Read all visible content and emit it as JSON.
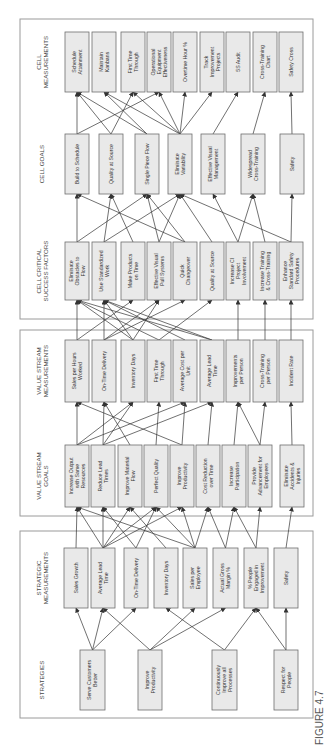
{
  "figure": {
    "caption": "FIGURE 4.7"
  },
  "columns": [
    {
      "id": "strategies",
      "heading": [
        "STRATEGIES"
      ],
      "x": 37,
      "w": 60,
      "boxes": [
        {
          "lines": [
            "Serve Customers",
            "Better"
          ],
          "y": 80,
          "h": 25
        },
        {
          "lines": [
            "Improve",
            "Productivity"
          ],
          "y": 138,
          "h": 24
        },
        {
          "lines": [
            "Continuously",
            "Improve all",
            "Processes"
          ],
          "y": 212,
          "h": 25
        },
        {
          "lines": [
            "Respect for",
            "People"
          ],
          "y": 274,
          "h": 24
        }
      ]
    },
    {
      "id": "strategic_measurements",
      "heading": [
        "STRATEGIC",
        "MEASUREMENTS"
      ],
      "x": 139,
      "w": 60,
      "boxes": [
        {
          "lines": [
            "Sales Growth"
          ],
          "y": 64,
          "h": 24
        },
        {
          "lines": [
            "Average Lead",
            "Time"
          ],
          "y": 91,
          "h": 24
        },
        {
          "lines": [
            "On-Time Delivery"
          ],
          "y": 124,
          "h": 24
        },
        {
          "lines": [
            "Inventory Days"
          ],
          "y": 154,
          "h": 24
        },
        {
          "lines": [
            "Sales per",
            "Employee"
          ],
          "y": 183,
          "h": 24
        },
        {
          "lines": [
            "Actual Gross",
            "Margin %"
          ],
          "y": 213,
          "h": 25
        },
        {
          "lines": [
            "% People",
            "Engaged in",
            "Improvement"
          ],
          "y": 244,
          "h": 24
        },
        {
          "lines": [
            "Safety"
          ],
          "y": 274,
          "h": 24
        }
      ]
    },
    {
      "id": "value_stream_goals",
      "heading": [
        "VALUE STREAM",
        "GOALS"
      ],
      "x": 240,
      "w": 62,
      "boxes": [
        {
          "lines": [
            "Increase Output",
            "with Same",
            "Resources"
          ],
          "y": 65,
          "h": 24
        },
        {
          "lines": [
            "Reduce Lead",
            "Times"
          ],
          "y": 91,
          "h": 24
        },
        {
          "lines": [
            "Improve Material",
            "Flow"
          ],
          "y": 118,
          "h": 24
        },
        {
          "lines": [
            "Perfect Quality"
          ],
          "y": 144,
          "h": 24
        },
        {
          "lines": [
            "Improve",
            "Productivity"
          ],
          "y": 170,
          "h": 24
        },
        {
          "lines": [
            "Cost Reduction",
            "over Time"
          ],
          "y": 196,
          "h": 24
        },
        {
          "lines": [
            "Increase",
            "Participation"
          ],
          "y": 222,
          "h": 24
        },
        {
          "lines": [
            "Provide",
            "Advancement for",
            "Employees"
          ],
          "y": 248,
          "h": 24
        },
        {
          "lines": [
            "Eliminate",
            "Accidents &",
            "Injuries"
          ],
          "y": 280,
          "h": 24
        }
      ]
    },
    {
      "id": "value_stream_measurements",
      "heading": [
        "VALUE STREAM",
        "MEASUREMENTS"
      ],
      "x": 345,
      "w": 62,
      "boxes": [
        {
          "lines": [
            "Sales per Hours",
            "Worked"
          ],
          "y": 65,
          "h": 24
        },
        {
          "lines": [
            "On-Time Delivery"
          ],
          "y": 92,
          "h": 24
        },
        {
          "lines": [
            "Inventory Days"
          ],
          "y": 121,
          "h": 24
        },
        {
          "lines": [
            "First Time",
            "Through"
          ],
          "y": 147,
          "h": 24
        },
        {
          "lines": [
            "Average Cost per",
            "Unit"
          ],
          "y": 173,
          "h": 24
        },
        {
          "lines": [
            "Average Lead",
            "Time"
          ],
          "y": 200,
          "h": 24
        },
        {
          "lines": [
            "Improvements",
            "per Person"
          ],
          "y": 226,
          "h": 24
        },
        {
          "lines": [
            "Cross-Training",
            "per Person"
          ],
          "y": 253,
          "h": 24
        },
        {
          "lines": [
            "Incident Rate"
          ],
          "y": 279,
          "h": 24
        }
      ]
    },
    {
      "id": "cell_critical_success_factors",
      "heading": [
        "CELL CRITICAL",
        "SUCCESS FACTORS"
      ],
      "x": 447,
      "w": 58,
      "boxes": [
        {
          "lines": [
            "Eliminate",
            "Obstacles to",
            "Flow"
          ],
          "y": 65,
          "h": 24
        },
        {
          "lines": [
            "Use Standardized",
            "Work"
          ],
          "y": 92,
          "h": 24
        },
        {
          "lines": [
            "Make Products",
            "on Time"
          ],
          "y": 121,
          "h": 24
        },
        {
          "lines": [
            "Effective Visual",
            "Pull Systems"
          ],
          "y": 147,
          "h": 24
        },
        {
          "lines": [
            "Quick",
            "Changeover"
          ],
          "y": 173,
          "h": 24
        },
        {
          "lines": [
            "Quality at Source"
          ],
          "y": 200,
          "h": 24
        },
        {
          "lines": [
            "Increase CI",
            "Project",
            "Involvement"
          ],
          "y": 226,
          "h": 24
        },
        {
          "lines": [
            "Increase Training",
            "& Cross-Training"
          ],
          "y": 253,
          "h": 24
        },
        {
          "lines": [
            "Enhance",
            "Standard Safety",
            "Procedures"
          ],
          "y": 279,
          "h": 24
        }
      ]
    },
    {
      "id": "cell_goals",
      "heading": [
        "CELL GOALS"
      ],
      "x": 553,
      "w": 60,
      "boxes": [
        {
          "lines": [
            "Build to Schedule"
          ],
          "y": 65,
          "h": 24
        },
        {
          "lines": [
            "Quality at Source"
          ],
          "y": 99,
          "h": 24
        },
        {
          "lines": [
            "Single Piece Flow"
          ],
          "y": 135,
          "h": 24
        },
        {
          "lines": [
            "Eliminate",
            "Variability"
          ],
          "y": 168,
          "h": 24
        },
        {
          "lines": [
            "Effective Visual",
            "Management"
          ],
          "y": 201,
          "h": 24
        },
        {
          "lines": [
            "Widespread",
            "Cross-Training"
          ],
          "y": 241,
          "h": 24
        },
        {
          "lines": [
            "Safety"
          ],
          "y": 280,
          "h": 24
        }
      ]
    },
    {
      "id": "cell_measurements",
      "heading": [
        "CELL",
        "MEASUREMENTS"
      ],
      "x": 655,
      "w": 60,
      "boxes": [
        {
          "lines": [
            "Schedule",
            "Attainment"
          ],
          "y": 65,
          "h": 24
        },
        {
          "lines": [
            "Maintain",
            "Kanbans"
          ],
          "y": 92,
          "h": 24
        },
        {
          "lines": [
            "First Time",
            "Through"
          ],
          "y": 121,
          "h": 24
        },
        {
          "lines": [
            "Operational",
            "Equipment",
            "Effectiveness"
          ],
          "y": 147,
          "h": 24
        },
        {
          "lines": [
            "Overtime Hour %"
          ],
          "y": 173,
          "h": 24
        },
        {
          "lines": [
            "Track",
            "Improvement",
            "Projects"
          ],
          "y": 200,
          "h": 24
        },
        {
          "lines": [
            "5S Audit"
          ],
          "y": 226,
          "h": 24
        },
        {
          "lines": [
            "Cross-Training",
            "Chart"
          ],
          "y": 253,
          "h": 24
        },
        {
          "lines": [
            "Safety Cross"
          ],
          "y": 279,
          "h": 24
        }
      ]
    }
  ],
  "panels": [
    {
      "id": "strategic-panel",
      "x": 29,
      "y": 20,
      "w": 187,
      "h": 293
    },
    {
      "id": "value-stream-panel",
      "x": 231,
      "y": 20,
      "w": 186,
      "h": 293
    },
    {
      "id": "cell-panel",
      "x": 428,
      "y": 20,
      "w": 300,
      "h": 293
    }
  ],
  "links": [
    [
      0,
      0,
      1,
      0
    ],
    [
      0,
      0,
      1,
      1
    ],
    [
      0,
      0,
      1,
      2
    ],
    [
      0,
      1,
      1,
      1
    ],
    [
      0,
      1,
      1,
      4
    ],
    [
      0,
      1,
      1,
      5
    ],
    [
      0,
      2,
      1,
      3
    ],
    [
      0,
      2,
      1,
      6
    ],
    [
      0,
      3,
      1,
      6
    ],
    [
      0,
      3,
      1,
      7
    ],
    [
      1,
      0,
      2,
      0
    ],
    [
      1,
      1,
      2,
      0
    ],
    [
      1,
      1,
      2,
      1
    ],
    [
      1,
      1,
      2,
      2
    ],
    [
      1,
      1,
      2,
      3
    ],
    [
      1,
      2,
      2,
      1
    ],
    [
      1,
      2,
      2,
      3
    ],
    [
      1,
      3,
      2,
      2
    ],
    [
      1,
      4,
      2,
      0
    ],
    [
      1,
      4,
      2,
      3
    ],
    [
      1,
      4,
      2,
      4
    ],
    [
      1,
      5,
      2,
      5
    ],
    [
      1,
      5,
      2,
      6
    ],
    [
      1,
      6,
      2,
      6
    ],
    [
      1,
      6,
      2,
      7
    ],
    [
      1,
      7,
      2,
      8
    ],
    [
      1,
      1,
      2,
      4
    ],
    [
      1,
      4,
      2,
      5
    ],
    [
      2,
      0,
      3,
      0
    ],
    [
      2,
      0,
      3,
      2
    ],
    [
      2,
      0,
      3,
      4
    ],
    [
      2,
      1,
      3,
      1
    ],
    [
      2,
      1,
      3,
      2
    ],
    [
      2,
      1,
      3,
      5
    ],
    [
      2,
      2,
      3,
      1
    ],
    [
      2,
      3,
      3,
      3
    ],
    [
      2,
      4,
      3,
      0
    ],
    [
      2,
      4,
      3,
      4
    ],
    [
      2,
      5,
      3,
      5
    ],
    [
      2,
      6,
      3,
      6
    ],
    [
      2,
      7,
      3,
      6
    ],
    [
      2,
      7,
      3,
      7
    ],
    [
      2,
      8,
      3,
      8
    ],
    [
      3,
      0,
      4,
      0
    ],
    [
      3,
      0,
      4,
      2
    ],
    [
      3,
      1,
      4,
      1
    ],
    [
      3,
      1,
      4,
      3
    ],
    [
      3,
      1,
      4,
      4
    ],
    [
      3,
      2,
      4,
      0
    ],
    [
      3,
      2,
      4,
      1
    ],
    [
      3,
      2,
      4,
      3
    ],
    [
      3,
      3,
      4,
      0
    ],
    [
      3,
      3,
      4,
      5
    ],
    [
      3,
      4,
      4,
      1
    ],
    [
      3,
      5,
      4,
      0
    ],
    [
      3,
      5,
      4,
      1
    ],
    [
      3,
      6,
      4,
      6
    ],
    [
      3,
      7,
      4,
      7
    ],
    [
      3,
      8,
      4,
      8
    ],
    [
      4,
      0,
      5,
      0
    ],
    [
      4,
      0,
      5,
      2
    ],
    [
      4,
      1,
      5,
      1
    ],
    [
      4,
      1,
      5,
      3
    ],
    [
      4,
      2,
      5,
      1
    ],
    [
      4,
      3,
      5,
      3
    ],
    [
      4,
      4,
      5,
      0
    ],
    [
      4,
      4,
      5,
      2
    ],
    [
      4,
      5,
      5,
      3
    ],
    [
      4,
      6,
      5,
      5
    ],
    [
      4,
      6,
      5,
      4
    ],
    [
      4,
      7,
      5,
      5
    ],
    [
      4,
      8,
      5,
      6
    ],
    [
      4,
      8,
      5,
      3
    ],
    [
      4,
      3,
      5,
      2
    ],
    [
      5,
      0,
      6,
      0
    ],
    [
      5,
      0,
      6,
      3
    ],
    [
      5,
      1,
      6,
      0
    ],
    [
      5,
      1,
      6,
      2
    ],
    [
      5,
      2,
      6,
      0
    ],
    [
      5,
      2,
      6,
      1
    ],
    [
      5,
      3,
      6,
      1
    ],
    [
      5,
      3,
      6,
      2
    ],
    [
      5,
      3,
      6,
      3
    ],
    [
      5,
      3,
      6,
      4
    ],
    [
      5,
      3,
      6,
      5
    ],
    [
      5,
      4,
      6,
      6
    ],
    [
      5,
      5,
      6,
      7
    ],
    [
      5,
      6,
      6,
      8
    ]
  ]
}
